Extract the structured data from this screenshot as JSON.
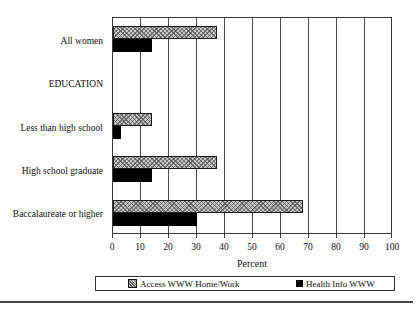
{
  "chart_data": {
    "type": "bar",
    "orientation": "horizontal",
    "categories": [
      "All women",
      "EDUCATION",
      "Less than high school",
      "High school graduate",
      "Baccalaureate or higher"
    ],
    "series": [
      {
        "name": "Access WWW Home/Work",
        "style": "hatched",
        "values": [
          37,
          null,
          14,
          37,
          68
        ]
      },
      {
        "name": "Health Info WWW",
        "style": "solid",
        "values": [
          14,
          null,
          3,
          14,
          30
        ]
      }
    ],
    "xlabel": "Percent",
    "xlim": [
      0,
      100
    ],
    "xticks": [
      0,
      10,
      20,
      30,
      40,
      50,
      60,
      70,
      80,
      90,
      100
    ],
    "grid": true,
    "legend_position": "bottom"
  },
  "colors": {
    "hatched_fill": "#c7c7c7",
    "hatch_line": "#464646",
    "solid_fill": "#000000",
    "frame": "#3a3a3a",
    "background": "#ffffff"
  }
}
